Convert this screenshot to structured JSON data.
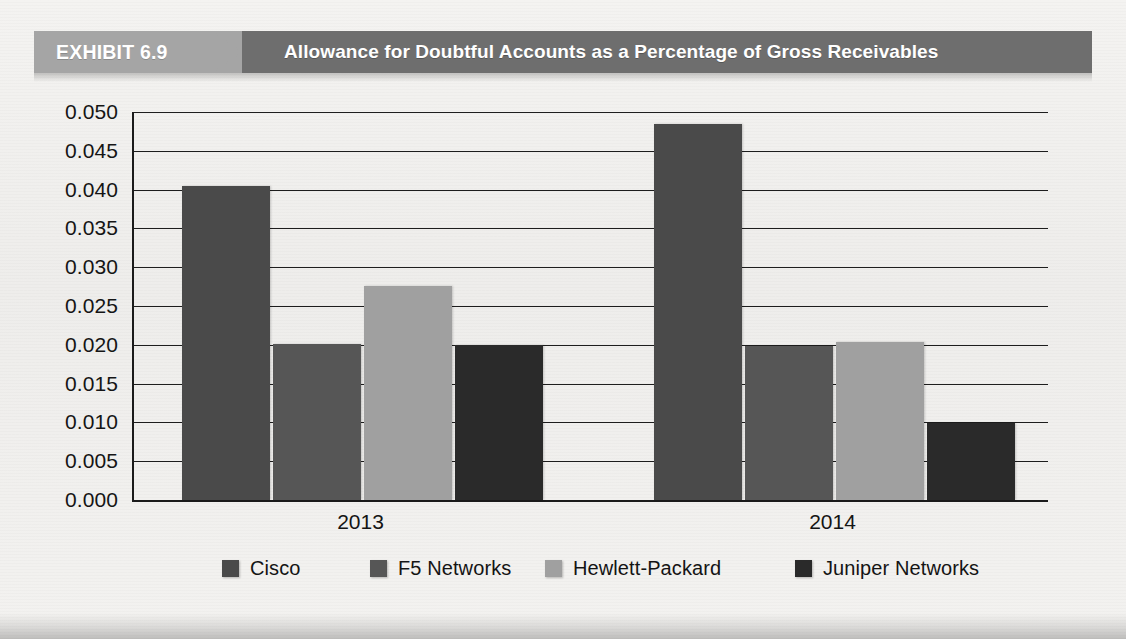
{
  "exhibit": {
    "tab_label": "EXHIBIT 6.9",
    "title": "Allowance for Doubtful Accounts as a Percentage of Gross Receivables"
  },
  "colors": {
    "banner_tab": "#a5a5a5",
    "banner_title": "#6e6e6e",
    "page_background": "#f2f1ef",
    "axis": "#1b1b1b",
    "cisco": "#4a4a4a",
    "f5_networks": "#565656",
    "hewlett_packard": "#a0a0a0",
    "juniper_networks": "#2a2a2a"
  },
  "chart_data": {
    "type": "bar",
    "title": "Allowance for Doubtful Accounts as a Percentage of Gross Receivables",
    "xlabel": "",
    "ylabel": "",
    "categories": [
      "2013",
      "2014"
    ],
    "ylim": [
      0.0,
      0.05
    ],
    "ytick_step": 0.005,
    "ytick_labels": [
      "0.050",
      "0.045",
      "0.040",
      "0.035",
      "0.030",
      "0.025",
      "0.020",
      "0.015",
      "0.010",
      "0.005",
      "0.000"
    ],
    "ytick_values": [
      0.05,
      0.045,
      0.04,
      0.035,
      0.03,
      0.025,
      0.02,
      0.015,
      0.01,
      0.005,
      0.0
    ],
    "grid": true,
    "legend_position": "bottom",
    "series": [
      {
        "name": "Cisco",
        "color": "#4a4a4a",
        "values": [
          0.0405,
          0.0485
        ]
      },
      {
        "name": "F5 Networks",
        "color": "#565656",
        "values": [
          0.0201,
          0.0198
        ]
      },
      {
        "name": "Hewlett-Packard",
        "color": "#a0a0a0",
        "values": [
          0.0276,
          0.0203
        ]
      },
      {
        "name": "Juniper Networks",
        "color": "#2a2a2a",
        "values": [
          0.02,
          0.0099
        ]
      }
    ]
  }
}
